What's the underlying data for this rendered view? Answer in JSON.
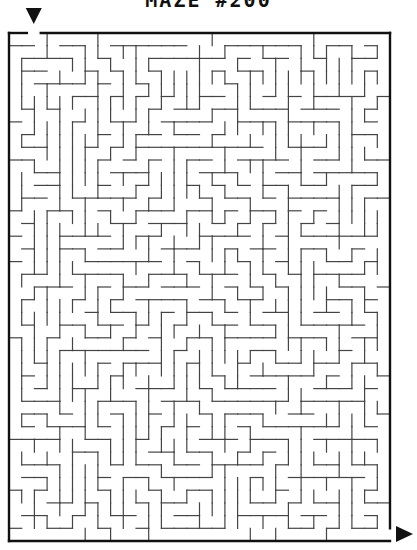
{
  "title": "MAZE #200",
  "maze": {
    "cols": 30,
    "rows": 40,
    "origin_x": 9,
    "origin_y": 33,
    "cell": 12.7,
    "border_color": "#111111",
    "wall_color": "#444444",
    "start": {
      "label": "start-marker",
      "col": 2,
      "side": "top"
    },
    "exit": {
      "label": "exit-marker",
      "row": 39,
      "side": "right"
    },
    "seed": 200
  }
}
